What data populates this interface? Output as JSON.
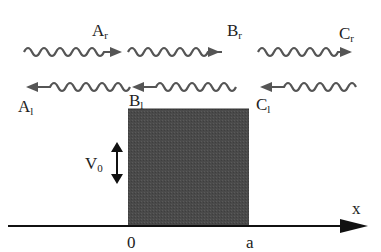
{
  "diagram": {
    "type": "potential-barrier-scattering",
    "waves_top": [
      {
        "label": "A",
        "sub": "r",
        "direction": "right"
      },
      {
        "label": "B",
        "sub": "r",
        "direction": "right"
      },
      {
        "label": "C",
        "sub": "r",
        "direction": "right"
      }
    ],
    "waves_bottom": [
      {
        "label": "A",
        "sub": "l",
        "direction": "left"
      },
      {
        "label": "B",
        "sub": "l",
        "direction": "left"
      },
      {
        "label": "C",
        "sub": "l",
        "direction": "left"
      }
    ],
    "barrier": {
      "height_label": "V",
      "height_sub": "0",
      "color": "#4a4a4a"
    },
    "axis": {
      "label": "x",
      "ticks": [
        "0",
        "a"
      ]
    },
    "colors": {
      "wave": "#555555",
      "barrier": "#4a4a4a",
      "axis": "#111111"
    }
  }
}
